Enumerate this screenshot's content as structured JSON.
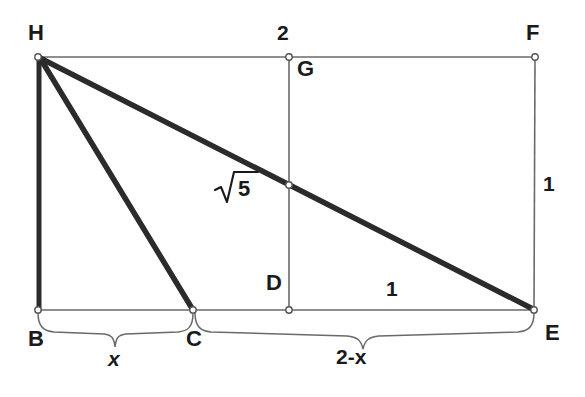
{
  "figure": {
    "background_color": "#ffffff",
    "line_color_thin": "#555555",
    "line_color_bold": "#2b2b2b",
    "text_color": "#1a1a1a",
    "points": [
      {
        "id": "H",
        "label": "H",
        "x": 38,
        "y": 57,
        "marker": true
      },
      {
        "id": "G",
        "label": "G",
        "x": 289,
        "y": 57,
        "marker": true
      },
      {
        "id": "F",
        "label": "F",
        "x": 535,
        "y": 57,
        "marker": true
      },
      {
        "id": "B",
        "label": "B",
        "x": 38,
        "y": 310,
        "marker": true
      },
      {
        "id": "C",
        "label": "C",
        "x": 193,
        "y": 310,
        "marker": true
      },
      {
        "id": "D",
        "label": "D",
        "x": 289,
        "y": 310,
        "marker": true
      },
      {
        "id": "E",
        "label": "E",
        "x": 534,
        "y": 310,
        "marker": true
      },
      {
        "id": "I",
        "label": "",
        "x": 289,
        "y": 185,
        "marker": true
      }
    ],
    "segments": [
      {
        "id": "HF",
        "from": "H",
        "to": "F",
        "weight": "thin"
      },
      {
        "id": "FE",
        "from": "F",
        "to": "E",
        "weight": "thin"
      },
      {
        "id": "BE",
        "from": "B",
        "to": "E",
        "weight": "thin"
      },
      {
        "id": "GD",
        "from": "G",
        "to": "D",
        "weight": "thin"
      },
      {
        "id": "HB",
        "from": "H",
        "to": "B",
        "weight": "bold"
      },
      {
        "id": "HC",
        "from": "H",
        "to": "C",
        "weight": "bold"
      },
      {
        "id": "HE",
        "from": "H",
        "to": "E",
        "weight": "bold"
      }
    ],
    "measurements": {
      "top": "2",
      "right": "1",
      "bottom_right": "1",
      "hypotenuse": "5",
      "hypotenuse_notation": "sqrt",
      "brace_left": "x",
      "brace_right": "2-x"
    },
    "braces": [
      {
        "id": "brace-x",
        "from_x": 38,
        "to_x": 193,
        "y": 318,
        "label": "x"
      },
      {
        "id": "brace-2-minus-x",
        "from_x": 193,
        "to_x": 534,
        "y": 318,
        "label": "2-x"
      }
    ]
  }
}
